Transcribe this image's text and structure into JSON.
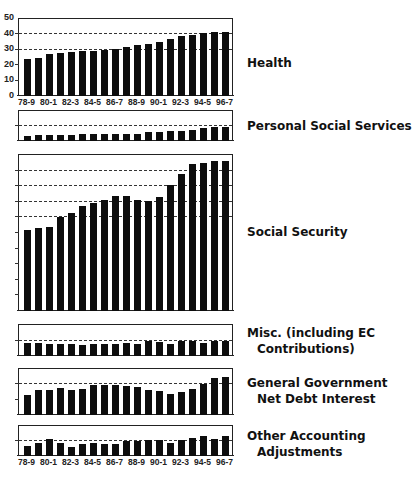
{
  "chart_data": [
    {
      "type": "bar",
      "title": "Health",
      "categories": [
        "78-9",
        "79-80",
        "80-1",
        "81-2",
        "82-3",
        "83-4",
        "84-5",
        "85-6",
        "86-7",
        "87-8",
        "88-9",
        "89-90",
        "90-1",
        "91-2",
        "92-3",
        "93-4",
        "94-5",
        "95-6",
        "96-7"
      ],
      "values": [
        24,
        25,
        27,
        28,
        28.5,
        29,
        29.5,
        30,
        30.5,
        32,
        33,
        33.5,
        35,
        37,
        39,
        39.5,
        41,
        41.5,
        41.5
      ],
      "ylim": [
        0,
        50
      ],
      "yticks": [
        0,
        10,
        20,
        30,
        40,
        50
      ],
      "dashed_lines": [
        30,
        40
      ],
      "xlabel": "",
      "ylabel": ""
    },
    {
      "type": "bar",
      "title": "Personal Social Services",
      "categories": [
        "78-9",
        "79-80",
        "80-1",
        "81-2",
        "82-3",
        "83-4",
        "84-5",
        "85-6",
        "86-7",
        "87-8",
        "88-9",
        "89-90",
        "90-1",
        "91-2",
        "92-3",
        "93-4",
        "94-5",
        "95-6",
        "96-7"
      ],
      "values": [
        3.5,
        4,
        4,
        4,
        4,
        4.5,
        4.5,
        4.5,
        5,
        5,
        5,
        6,
        6,
        6.5,
        7,
        7.5,
        9,
        9.5,
        9.5
      ],
      "ylim": [
        0,
        20
      ],
      "dashed_lines": [
        10
      ]
    },
    {
      "type": "bar",
      "title": "Social Security",
      "categories": [
        "78-9",
        "79-80",
        "80-1",
        "81-2",
        "82-3",
        "83-4",
        "84-5",
        "85-6",
        "86-7",
        "87-8",
        "88-9",
        "89-90",
        "90-1",
        "91-2",
        "92-3",
        "93-4",
        "94-5",
        "95-6",
        "96-7"
      ],
      "values": [
        52,
        53,
        54,
        60,
        63,
        67,
        69,
        71,
        74,
        73.5,
        71,
        70.5,
        73,
        81,
        88,
        94,
        95,
        96,
        96
      ],
      "ylim": [
        0,
        100
      ],
      "dashed_lines": [
        60,
        70,
        80,
        90
      ]
    },
    {
      "type": "bar",
      "title": "Misc. (including EC Contributions)",
      "categories": [
        "78-9",
        "79-80",
        "80-1",
        "81-2",
        "82-3",
        "83-4",
        "84-5",
        "85-6",
        "86-7",
        "87-8",
        "88-9",
        "89-90",
        "90-1",
        "91-2",
        "92-3",
        "93-4",
        "94-5",
        "95-6",
        "96-7"
      ],
      "values": [
        8.5,
        8.5,
        7.5,
        7.5,
        8,
        7,
        7.5,
        7.5,
        8,
        8.5,
        8,
        9.5,
        9,
        8,
        9.5,
        9.5,
        8.5,
        10,
        9.5
      ],
      "ylim": [
        0,
        20
      ],
      "dashed_lines": [
        10
      ]
    },
    {
      "type": "bar",
      "title": "General Government Net Debt Interest",
      "categories": [
        "78-9",
        "79-80",
        "80-1",
        "81-2",
        "82-3",
        "83-4",
        "84-5",
        "85-6",
        "86-7",
        "87-8",
        "88-9",
        "89-90",
        "90-1",
        "91-2",
        "92-3",
        "93-4",
        "94-5",
        "95-6",
        "96-7"
      ],
      "values": [
        13,
        16,
        16.5,
        17.5,
        16.5,
        17,
        19.5,
        19.5,
        19.5,
        19,
        18,
        16,
        15.5,
        14,
        15,
        17,
        20,
        24,
        25
      ],
      "ylim": [
        0,
        30
      ],
      "yticks": [
        10,
        20
      ],
      "dashed_lines": [
        20
      ]
    },
    {
      "type": "bar",
      "title": "Other Accounting Adjustments",
      "categories": [
        "78-9",
        "79-80",
        "80-1",
        "81-2",
        "82-3",
        "83-4",
        "84-5",
        "85-6",
        "86-7",
        "87-8",
        "88-9",
        "89-90",
        "90-1",
        "91-2",
        "92-3",
        "93-4",
        "94-5",
        "95-6",
        "96-7"
      ],
      "values": [
        6.5,
        9,
        11.5,
        8.5,
        6,
        8,
        8.5,
        8,
        8,
        10,
        10,
        10.5,
        10.5,
        9,
        10.5,
        12,
        13.5,
        11.5,
        13.5
      ],
      "ylim": [
        0,
        20
      ],
      "dashed_lines": [
        10
      ]
    }
  ],
  "x_tick_labels": [
    "78-9",
    "80-1",
    "82-3",
    "84-5",
    "86-7",
    "88-9",
    "90-1",
    "92-3",
    "94-5",
    "96-7"
  ],
  "health_y_labels": [
    "50",
    "40",
    "30",
    "20",
    "10",
    "0"
  ],
  "labels": {
    "health": "Health",
    "pss": "Personal Social Services",
    "ss": "Social Security",
    "misc_l1": "Misc. (including EC",
    "misc_l2": "Contributions)",
    "ggndi_l1": "General Government",
    "ggndi_l2": "Net Debt Interest",
    "oaa_l1": "Other Accounting",
    "oaa_l2": "Adjustments"
  }
}
